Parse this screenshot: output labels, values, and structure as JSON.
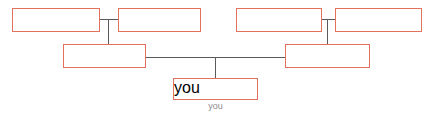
{
  "diagram": {
    "type": "family-tree",
    "title": "",
    "canvas": {
      "width": 435,
      "height": 116,
      "background": "#ffffff"
    },
    "style": {
      "box_border_color": "#e2725b",
      "box_fill_color": "#ffffff",
      "connector_color": "#5a5a5a",
      "label_color": "#8c8c8c"
    },
    "nodes": [
      {
        "id": "paternal-grandparent-1",
        "label": "",
        "x": 12,
        "y": 8,
        "width": 88,
        "height": 24,
        "generation": "grandparents",
        "side": "left"
      },
      {
        "id": "paternal-grandparent-2",
        "label": "",
        "x": 118,
        "y": 8,
        "width": 83,
        "height": 24,
        "generation": "grandparents",
        "side": "left"
      },
      {
        "id": "maternal-grandparent-1",
        "label": "",
        "x": 236,
        "y": 8,
        "width": 86,
        "height": 24,
        "generation": "grandparents",
        "side": "right"
      },
      {
        "id": "maternal-grandparent-2",
        "label": "",
        "x": 335,
        "y": 8,
        "width": 87,
        "height": 24,
        "generation": "grandparents",
        "side": "right"
      },
      {
        "id": "parent-left",
        "label": "",
        "x": 63,
        "y": 44,
        "width": 83,
        "height": 24,
        "generation": "parents",
        "side": "left"
      },
      {
        "id": "parent-right",
        "label": "",
        "x": 285,
        "y": 44,
        "width": 85,
        "height": 24,
        "generation": "parents",
        "side": "right"
      },
      {
        "id": "self",
        "label": "you",
        "x": 173,
        "y": 78,
        "width": 85,
        "height": 22,
        "generation": "self",
        "side": "center"
      }
    ],
    "labels": [
      {
        "for": "self",
        "text": "you",
        "x": 173,
        "y": 101,
        "width": 85
      }
    ],
    "connectors": [
      {
        "id": "left-couple-bar",
        "orientation": "horizontal",
        "x": 100,
        "y": 19,
        "length": 18
      },
      {
        "id": "left-couple-drop",
        "orientation": "vertical",
        "x": 108,
        "y": 19,
        "length": 25
      },
      {
        "id": "right-couple-bar",
        "orientation": "horizontal",
        "x": 322,
        "y": 19,
        "length": 13
      },
      {
        "id": "right-couple-drop",
        "orientation": "vertical",
        "x": 327,
        "y": 19,
        "length": 25
      },
      {
        "id": "parents-bar",
        "orientation": "horizontal",
        "x": 146,
        "y": 57,
        "length": 139
      },
      {
        "id": "self-drop",
        "orientation": "vertical",
        "x": 215,
        "y": 57,
        "length": 21
      }
    ]
  }
}
